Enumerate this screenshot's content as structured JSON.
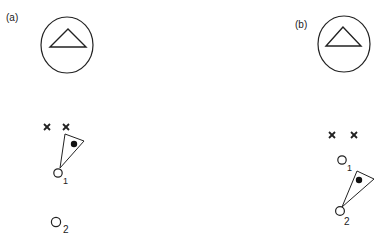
{
  "panels": [
    {
      "label": "(a)",
      "landmark": {
        "shape": "circle-with-triangle"
      },
      "markers": [
        {
          "type": "cross"
        },
        {
          "type": "cross"
        }
      ],
      "positions": [
        {
          "label": "1"
        },
        {
          "label": "2"
        }
      ],
      "agent": {
        "shape": "viewing-cone-with-dot",
        "at_position": "1"
      }
    },
    {
      "label": "(b)",
      "landmark": {
        "shape": "circle-with-triangle"
      },
      "markers": [
        {
          "type": "cross"
        },
        {
          "type": "cross"
        }
      ],
      "positions": [
        {
          "label": "1"
        },
        {
          "label": "2"
        }
      ],
      "agent": {
        "shape": "viewing-cone-with-dot",
        "at_position": "2"
      }
    }
  ],
  "colors": {
    "stroke": "#222222",
    "background": "#ffffff"
  }
}
